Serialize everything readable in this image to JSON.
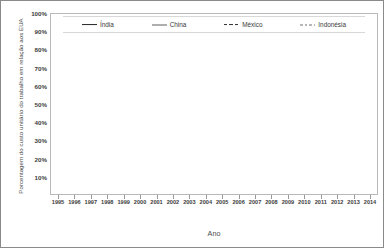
{
  "chart_data": {
    "type": "line",
    "title": "",
    "xlabel": "Ano",
    "ylabel": "Porcentagem do custo unitário do trabalho em relação aos EUA",
    "categories": [
      "1995",
      "1996",
      "1997",
      "1998",
      "1999",
      "2000",
      "2001",
      "2002",
      "2003",
      "2004",
      "2005",
      "2006",
      "2007",
      "2008",
      "2009",
      "2010",
      "2011",
      "2012",
      "2013",
      "2014"
    ],
    "x": [
      1995,
      1996,
      1997,
      1998,
      1999,
      2000,
      2001,
      2002,
      2003,
      2004,
      2005,
      2006,
      2007,
      2008,
      2009,
      2010,
      2011,
      2012,
      2013,
      2014
    ],
    "ylim": [
      0,
      100
    ],
    "yticks": [
      "10%",
      "20%",
      "30%",
      "40%",
      "50%",
      "60%",
      "70%",
      "80%",
      "90%",
      "100%"
    ],
    "ytick_values": [
      10,
      20,
      30,
      40,
      50,
      60,
      70,
      80,
      90,
      100
    ],
    "grid": true,
    "legend_position": "top",
    "series": [
      {
        "name": "Índia",
        "style": "solid-thick",
        "color": "#262626",
        "values": [
          36.0,
          37.0,
          37.8,
          38.0,
          38.3,
          39.2,
          38.5,
          37.3,
          33.6,
          34.8,
          35.2,
          34.3,
          33.3,
          33.0,
          31.2,
          33.4,
          35.0,
          35.4,
          35.8,
          36.0
        ]
      },
      {
        "name": "China",
        "style": "solid-thin",
        "color": "#5e5e5e",
        "values": [
          39.2,
          38.1,
          37.6,
          37.7,
          38.2,
          39.2,
          41.4,
          44.8,
          42.0,
          42.7,
          40.4,
          38.2,
          36.8,
          38.6,
          37.6,
          42.2,
          43.5,
          46.4,
          44.0,
          45.0
        ]
      },
      {
        "name": "México",
        "style": "dashed-thick",
        "color": "#2e2e2e",
        "values": [
          55.0,
          53.0,
          51.8,
          51.6,
          51.4,
          51.2,
          51.5,
          51.3,
          50.6,
          51.4,
          50.0,
          48.4,
          47.0,
          45.0,
          42.8,
          42.2,
          42.0,
          42.4,
          43.0,
          43.3
        ]
      },
      {
        "name": "Indonésia",
        "style": "dashed-thin",
        "color": "#707070",
        "values": [
          50.2,
          50.6,
          50.6,
          50.2,
          50.4,
          50.8,
          51.6,
          52.0,
          52.4,
          51.4,
          53.6,
          55.8,
          57.2,
          56.2,
          54.0,
          57.0,
          59.0,
          60.0,
          60.6,
          61.2
        ]
      }
    ]
  }
}
